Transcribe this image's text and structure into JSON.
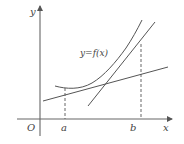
{
  "diagram": {
    "type": "function-graph",
    "labels": {
      "y_axis": "y",
      "x_axis": "x",
      "origin": "O",
      "point_a": "a",
      "point_b": "b",
      "curve": "y=f(x)"
    },
    "colors": {
      "stroke": "#555555",
      "text": "#444444",
      "background": "#ffffff"
    },
    "elements": {
      "x_axis": {
        "from": [
          17,
          119
        ],
        "to": [
          172,
          119
        ]
      },
      "y_axis": {
        "from": [
          40,
          136
        ],
        "to": [
          40,
          5
        ]
      },
      "curve_points": [
        [
          55,
          86
        ],
        [
          65,
          88
        ],
        [
          78,
          88
        ],
        [
          92,
          83
        ],
        [
          105,
          74
        ],
        [
          118,
          60
        ],
        [
          130,
          42
        ],
        [
          142,
          20
        ]
      ],
      "line_1": {
        "from": [
          43,
          101
        ],
        "to": [
          168,
          67
        ]
      },
      "line_2": {
        "from": [
          88,
          106
        ],
        "to": [
          155,
          22
        ]
      },
      "dashed_a": {
        "x": 65,
        "from_y": 88,
        "to_y": 119
      },
      "dashed_b": {
        "x": 141,
        "from_y": 44,
        "to_y": 119
      }
    }
  }
}
